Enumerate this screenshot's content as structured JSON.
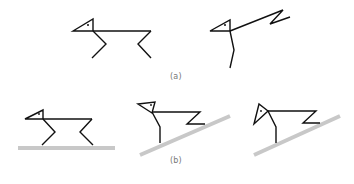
{
  "figure": {
    "panel_a": {
      "label": "(a)",
      "figures": [
        {
          "name": "quadruped-standing",
          "description": "stick figure with triangle head, horizontal body, two bent legs"
        },
        {
          "name": "stick-figure-raised-body",
          "description": "triangle head, body raised diagonally up with zig-zag tail, single vertical leg"
        }
      ]
    },
    "panel_b": {
      "label": "(b)",
      "figures": [
        {
          "name": "quadruped-on-flat-ground",
          "description": "standing stick figure on horizontal gray ground"
        },
        {
          "name": "figure-on-slope-1",
          "description": "stick figure with zig-zag body on sloped gray ground"
        },
        {
          "name": "figure-on-slope-2",
          "description": "stick figure with tilted head on sloped gray ground"
        }
      ]
    },
    "colors": {
      "line": "#111111",
      "ground": "#c8c8c8",
      "label": "#777777",
      "background": "#ffffff"
    }
  }
}
